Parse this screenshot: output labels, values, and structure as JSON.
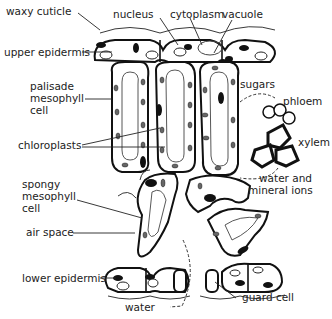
{
  "labels": {
    "waxy_cuticle": "waxy cuticle",
    "nucleus": "nucleus",
    "cytoplasm": "cytoplasm",
    "vacuole": "vacuole",
    "upper_epidermis": "upper epidermis",
    "palisade_1": "palisade",
    "palisade_2": "mesophyll",
    "palisade_3": "cell",
    "chloroplasts": "chloroplasts",
    "sugars": "sugars",
    "phloem": "phloem",
    "xylem": "xylem",
    "water_minerals_1": "water and",
    "water_minerals_2": "mineral ions",
    "spongy_1": "spongy",
    "spongy_2": "mesophyll",
    "spongy_3": "cell",
    "air_space": "air space",
    "lower_epidermis": "lower epidermis",
    "water": "water",
    "guard_cell": "guard cell"
  },
  "colors": {
    "line": "#111111",
    "chloroplast": "#666666",
    "text": "#222222"
  }
}
